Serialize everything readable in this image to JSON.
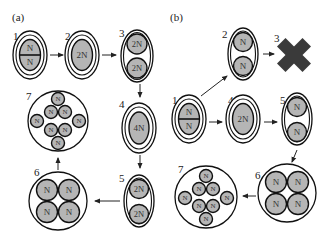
{
  "panels": {
    "a": {
      "label": "(a)",
      "cells": {
        "c1": {
          "num": "1",
          "nuclei": [
            "N",
            "N"
          ]
        },
        "c2": {
          "num": "2",
          "nuclei": [
            "2N"
          ]
        },
        "c3": {
          "num": "3",
          "nuclei": [
            "2N",
            "2N"
          ]
        },
        "c4": {
          "num": "4",
          "nuclei": [
            "4N"
          ]
        },
        "c5": {
          "num": "5",
          "nuclei": [
            "2N",
            "2N"
          ]
        },
        "c6": {
          "num": "6",
          "nuclei": [
            "N",
            "N",
            "N",
            "N"
          ]
        },
        "c7": {
          "num": "7",
          "nuclei": [
            "N",
            "N",
            "N",
            "N",
            "N",
            "N",
            "N",
            "N"
          ]
        }
      }
    },
    "b": {
      "label": "(b)",
      "cells": {
        "c1": {
          "num": "1",
          "nuclei": [
            "N",
            "N"
          ]
        },
        "c2": {
          "num": "2",
          "nuclei": [
            "N",
            "N"
          ]
        },
        "c3": {
          "num": "3",
          "symbol": "cross-mark (degenerated)"
        },
        "c4": {
          "num": "4",
          "nuclei": [
            "2N"
          ]
        },
        "c5": {
          "num": "5",
          "nuclei": [
            "N",
            "N"
          ]
        },
        "c6": {
          "num": "6",
          "nuclei": [
            "N",
            "N",
            "N",
            "N"
          ]
        },
        "c7": {
          "num": "7",
          "nuclei": [
            "N",
            "N",
            "N",
            "N",
            "N",
            "N",
            "N",
            "N"
          ]
        }
      }
    }
  },
  "colors": {
    "nucleus_fill": "#b5b5b5",
    "outline": "#111111",
    "cross": "#3a3a3a"
  }
}
